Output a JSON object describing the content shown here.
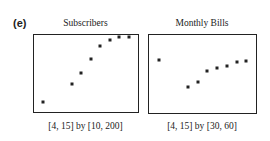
{
  "panel_label": "(e)",
  "chart_data": [
    {
      "type": "scatter",
      "title": "Subscribers",
      "window": "[4, 15] by [10, 200]",
      "xlim": [
        4,
        15
      ],
      "ylim": [
        10,
        200
      ],
      "grid": false,
      "x": [
        5,
        8,
        9,
        10,
        11,
        12,
        13,
        14
      ],
      "y": [
        34,
        80,
        106,
        141,
        172,
        188,
        219,
        250
      ]
    },
    {
      "type": "scatter",
      "title": "Monthly Bills",
      "window": "[4, 15] by [30, 60]",
      "xlim": [
        4,
        15
      ],
      "ylim": [
        30,
        60
      ],
      "grid": false,
      "x": [
        5,
        8,
        9,
        10,
        11,
        12,
        13,
        14
      ],
      "y": [
        50.5,
        40,
        42,
        46,
        47.5,
        48,
        49.5,
        50
      ]
    }
  ]
}
